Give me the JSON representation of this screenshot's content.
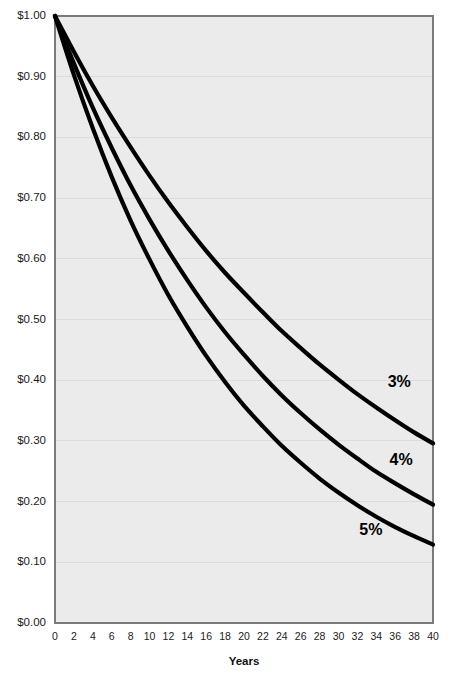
{
  "chart_data": {
    "type": "line",
    "title": "",
    "subtitle": "",
    "xlabel": "Years",
    "ylabel": "",
    "xlim": [
      0,
      40
    ],
    "ylim": [
      0.0,
      1.0
    ],
    "grid": true,
    "legend_position": "inline-right",
    "x": [
      0,
      2,
      4,
      6,
      8,
      10,
      12,
      14,
      16,
      18,
      20,
      22,
      24,
      26,
      28,
      30,
      32,
      34,
      36,
      38,
      40
    ],
    "xticks": [
      "0",
      "2",
      "4",
      "6",
      "8",
      "10",
      "12",
      "14",
      "16",
      "18",
      "20",
      "22",
      "24",
      "26",
      "28",
      "30",
      "32",
      "34",
      "36",
      "38",
      "40"
    ],
    "yticks": [
      "$0.00",
      "$0.10",
      "$0.20",
      "$0.30",
      "$0.40",
      "$0.50",
      "$0.60",
      "$0.70",
      "$0.80",
      "$0.90",
      "$1.00"
    ],
    "ytick_values": [
      0.0,
      0.1,
      0.2,
      0.3,
      0.4,
      0.5,
      0.6,
      0.7,
      0.8,
      0.9,
      1.0
    ],
    "series": [
      {
        "name": "3%",
        "label": "3%",
        "color": "#000000",
        "values": [
          1.0,
          0.941,
          0.885,
          0.833,
          0.784,
          0.737,
          0.693,
          0.652,
          0.613,
          0.577,
          0.544,
          0.512,
          0.481,
          0.453,
          0.426,
          0.401,
          0.377,
          0.355,
          0.334,
          0.314,
          0.296
        ]
      },
      {
        "name": "4%",
        "label": "4%",
        "color": "#000000",
        "values": [
          1.0,
          0.922,
          0.849,
          0.783,
          0.721,
          0.665,
          0.613,
          0.565,
          0.52,
          0.479,
          0.442,
          0.407,
          0.375,
          0.346,
          0.319,
          0.294,
          0.271,
          0.249,
          0.23,
          0.212,
          0.195
        ]
      },
      {
        "name": "5%",
        "label": "5%",
        "color": "#000000",
        "values": [
          1.0,
          0.903,
          0.815,
          0.735,
          0.663,
          0.599,
          0.54,
          0.488,
          0.44,
          0.397,
          0.358,
          0.324,
          0.292,
          0.264,
          0.238,
          0.215,
          0.194,
          0.175,
          0.158,
          0.143,
          0.129
        ]
      }
    ],
    "series_label_positions": [
      {
        "name": "3%",
        "x": 35.2,
        "y": 0.395
      },
      {
        "name": "4%",
        "x": 35.4,
        "y": 0.268
      },
      {
        "name": "5%",
        "x": 32.2,
        "y": 0.152
      }
    ],
    "colors": {
      "plot_background": "#ebebeb",
      "grid": "#dcdcdc",
      "axis": "#7a7a7a",
      "line": "#000000",
      "text": "#1a1a1a",
      "page_background": "#ffffff"
    }
  }
}
